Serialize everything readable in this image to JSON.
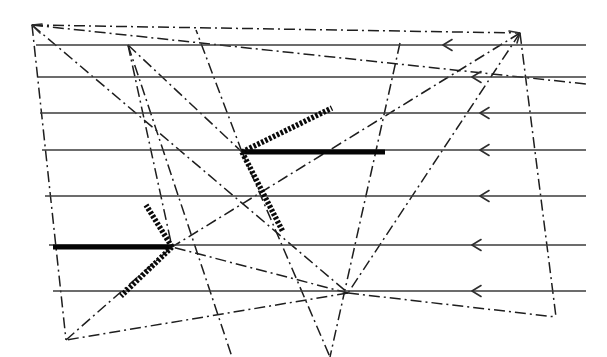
{
  "figure": {
    "kind": "line-diagram",
    "width": 607,
    "height": 357,
    "background_color": "#ffffff"
  },
  "chart_data": {
    "type": "line",
    "subtitle": "",
    "xlabel": "",
    "ylabel": "",
    "xlim": [
      0,
      607
    ],
    "ylim": [
      0,
      357
    ],
    "grid": false,
    "legend": null,
    "annotations": [],
    "tick_labels_x": [],
    "tick_labels_y": [],
    "colors": {
      "streamline": "#3b3b3b",
      "construction": "#1e1e1e",
      "thick_solid": "#050505",
      "beaded": "#0a0a0a",
      "background": "#ffffff"
    },
    "series": [
      {
        "name": "streamlines",
        "style": "solid",
        "arrow_direction": "left",
        "values": [
          {
            "id": "s1",
            "x1": 36,
            "y1": 45,
            "x2": 586,
            "y2": 45,
            "arrow_x": 443,
            "arrow_y": 45
          },
          {
            "id": "s2",
            "x1": 38,
            "y1": 77,
            "x2": 586,
            "y2": 77,
            "arrow_x": 472,
            "arrow_y": 77
          },
          {
            "id": "s3",
            "x1": 40,
            "y1": 113,
            "x2": 586,
            "y2": 113,
            "arrow_x": 480,
            "arrow_y": 113
          },
          {
            "id": "s4",
            "x1": 42,
            "y1": 150,
            "x2": 586,
            "y2": 150,
            "arrow_x": 480,
            "arrow_y": 150
          },
          {
            "id": "s5",
            "x1": 45,
            "y1": 196,
            "x2": 586,
            "y2": 196,
            "arrow_x": 480,
            "arrow_y": 196
          },
          {
            "id": "s6",
            "x1": 49,
            "y1": 245,
            "x2": 586,
            "y2": 245,
            "arrow_x": 472,
            "arrow_y": 245
          },
          {
            "id": "s7",
            "x1": 53,
            "y1": 291,
            "x2": 586,
            "y2": 291,
            "arrow_x": 472,
            "arrow_y": 291
          }
        ]
      },
      {
        "name": "construction-lines",
        "style": "dash-dot",
        "values": [
          {
            "id": "c1",
            "x1": 32,
            "y1": 25,
            "x2": 520,
            "y2": 33
          },
          {
            "id": "c2",
            "x1": 32,
            "y1": 25,
            "x2": 586,
            "y2": 84
          },
          {
            "id": "c3",
            "x1": 32,
            "y1": 25,
            "x2": 66,
            "y2": 340
          },
          {
            "id": "c4",
            "x1": 32,
            "y1": 25,
            "x2": 348,
            "y2": 293
          },
          {
            "id": "c5",
            "x1": 128,
            "y1": 45,
            "x2": 242,
            "y2": 152
          },
          {
            "id": "c6",
            "x1": 128,
            "y1": 45,
            "x2": 172,
            "y2": 247
          },
          {
            "id": "c7",
            "x1": 128,
            "y1": 45,
            "x2": 232,
            "y2": 357
          },
          {
            "id": "c8",
            "x1": 520,
            "y1": 33,
            "x2": 348,
            "y2": 293
          },
          {
            "id": "c9",
            "x1": 520,
            "y1": 33,
            "x2": 556,
            "y2": 317
          },
          {
            "id": "c10",
            "x1": 520,
            "y1": 33,
            "x2": 172,
            "y2": 247
          },
          {
            "id": "c11",
            "x1": 348,
            "y1": 293,
            "x2": 172,
            "y2": 247
          },
          {
            "id": "c12",
            "x1": 348,
            "y1": 293,
            "x2": 66,
            "y2": 340
          },
          {
            "id": "c13",
            "x1": 348,
            "y1": 293,
            "x2": 556,
            "y2": 317
          },
          {
            "id": "c14",
            "x1": 66,
            "y1": 340,
            "x2": 172,
            "y2": 247
          },
          {
            "id": "c15",
            "x1": 242,
            "y1": 152,
            "x2": 330,
            "y2": 357
          },
          {
            "id": "c16",
            "x1": 400,
            "y1": 43,
            "x2": 330,
            "y2": 357
          },
          {
            "id": "c17",
            "x1": 242,
            "y1": 152,
            "x2": 196,
            "y2": 30
          }
        ]
      },
      {
        "name": "thick-solid-segments",
        "style": "thick-solid",
        "values": [
          {
            "id": "t1",
            "x1": 242,
            "y1": 152,
            "x2": 385,
            "y2": 152
          },
          {
            "id": "t2",
            "x1": 53,
            "y1": 247,
            "x2": 172,
            "y2": 247
          }
        ]
      },
      {
        "name": "beaded-segments",
        "style": "beaded-dotted",
        "values": [
          {
            "id": "b1",
            "x1": 242,
            "y1": 152,
            "x2": 332,
            "y2": 108
          },
          {
            "id": "b2",
            "x1": 242,
            "y1": 152,
            "x2": 283,
            "y2": 232
          },
          {
            "id": "b3",
            "x1": 172,
            "y1": 247,
            "x2": 146,
            "y2": 205
          },
          {
            "id": "b4",
            "x1": 172,
            "y1": 247,
            "x2": 121,
            "y2": 296
          }
        ]
      }
    ],
    "vertices": [
      {
        "id": "v-top-left",
        "x": 32,
        "y": 25,
        "arrow": true
      },
      {
        "id": "v-top-right",
        "x": 520,
        "y": 33,
        "arrow": true
      },
      {
        "id": "v-upper-node",
        "x": 128,
        "y": 45,
        "arrow": false
      },
      {
        "id": "v-mid-node",
        "x": 242,
        "y": 152,
        "arrow": false
      },
      {
        "id": "v-left-node",
        "x": 172,
        "y": 247,
        "arrow": false
      },
      {
        "id": "v-lower-right",
        "x": 348,
        "y": 293,
        "arrow": false
      },
      {
        "id": "v-bottom-left",
        "x": 66,
        "y": 340,
        "arrow": false
      },
      {
        "id": "v-right-bottom",
        "x": 556,
        "y": 317,
        "arrow": false
      }
    ]
  }
}
